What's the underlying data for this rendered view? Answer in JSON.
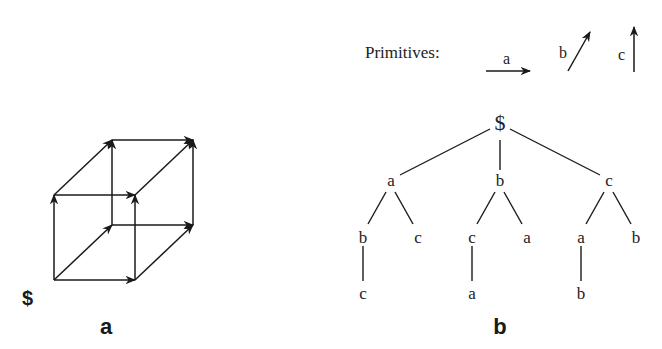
{
  "panel_a": {
    "label": "a",
    "start_symbol": "$",
    "cube": {
      "vertices": {
        "origin": [
          54,
          280
        ],
        "front_bottom_right": [
          135,
          280
        ],
        "front_top_left": [
          54,
          195
        ],
        "front_top_right": [
          135,
          195
        ],
        "back_bottom_left": [
          112,
          225
        ],
        "back_bottom_right": [
          193,
          225
        ],
        "back_top_left": [
          112,
          140
        ],
        "back_top_right": [
          193,
          140
        ]
      },
      "edges": [
        {
          "from": "origin",
          "to": "front_bottom_right",
          "primitive": "a"
        },
        {
          "from": "origin",
          "to": "back_bottom_left",
          "primitive": "b"
        },
        {
          "from": "origin",
          "to": "front_top_left",
          "primitive": "c"
        },
        {
          "from": "front_bottom_right",
          "to": "back_bottom_right",
          "primitive": "b"
        },
        {
          "from": "front_bottom_right",
          "to": "front_top_right",
          "primitive": "c"
        },
        {
          "from": "front_top_left",
          "to": "front_top_right",
          "primitive": "a"
        },
        {
          "from": "front_top_left",
          "to": "back_top_left",
          "primitive": "b"
        },
        {
          "from": "back_bottom_left",
          "to": "back_bottom_right",
          "primitive": "a"
        },
        {
          "from": "back_bottom_left",
          "to": "back_top_left",
          "primitive": "c"
        },
        {
          "from": "front_top_right",
          "to": "back_top_right",
          "primitive": "b"
        },
        {
          "from": "back_bottom_right",
          "to": "back_top_right",
          "primitive": "c"
        },
        {
          "from": "back_top_left",
          "to": "back_top_right",
          "primitive": "a"
        }
      ]
    }
  },
  "panel_b": {
    "label": "b",
    "primitives_title": "Primitives:",
    "primitives": [
      {
        "name": "a",
        "direction": "horizontal-right"
      },
      {
        "name": "b",
        "direction": "diagonal-up-right"
      },
      {
        "name": "c",
        "direction": "vertical-up"
      }
    ],
    "tree": {
      "root": "$",
      "level1": [
        "a",
        "b",
        "c"
      ],
      "level2": [
        "b",
        "c",
        "c",
        "a",
        "a",
        "b"
      ],
      "level3": [
        "c",
        "a",
        "b"
      ],
      "paths": [
        "abc",
        "ac",
        "bca",
        "ba",
        "cab",
        "cb"
      ]
    }
  }
}
